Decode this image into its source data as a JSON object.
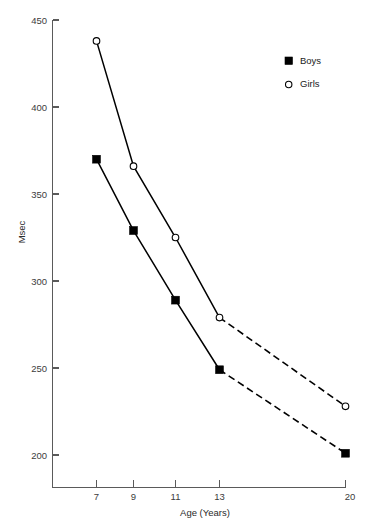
{
  "chart_data": {
    "type": "line",
    "title": "",
    "subtitle": "",
    "xlabel": "Age (Years)",
    "ylabel": "Msec",
    "x": [
      7,
      9,
      11,
      13,
      20
    ],
    "xtick_labels": [
      "7",
      "9",
      "11",
      "13",
      "20"
    ],
    "ytick_labels": [
      "450",
      "400",
      "350",
      "300",
      "250",
      "200"
    ],
    "yticks": [
      450,
      400,
      350,
      300,
      250,
      200
    ],
    "ylim": [
      185,
      450
    ],
    "xlim": [
      5.6,
      21.6
    ],
    "grid": false,
    "legend_position": "top-right",
    "series": [
      {
        "name": "Boys",
        "marker": "filled-square",
        "values": [
          370,
          329,
          289,
          249,
          201
        ],
        "solid_through_index": 3,
        "dashed_from_index": 3
      },
      {
        "name": "Girls",
        "marker": "open-circle",
        "values": [
          438,
          366,
          325,
          279,
          228
        ],
        "solid_through_index": 3,
        "dashed_from_index": 3
      }
    ],
    "annotations": []
  },
  "legend": {
    "items": [
      {
        "label": "Boys",
        "marker": "filled-square"
      },
      {
        "label": "Girls",
        "marker": "open-circle"
      }
    ]
  },
  "colors": {
    "line": "#000000",
    "axis": "#5a5a5a",
    "text": "#1a1a1a",
    "background": "#ffffff",
    "marker_fill_open": "#ffffff"
  }
}
